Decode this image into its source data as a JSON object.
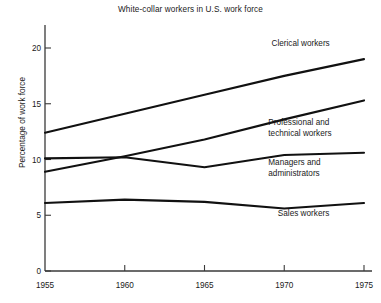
{
  "chart_data": {
    "type": "line",
    "title": "White-collar workers in U.S. work force",
    "xlabel": "",
    "ylabel": "Percentage of work force",
    "x": [
      1955,
      1960,
      1965,
      1970,
      1975
    ],
    "xticklabels": [
      "1955",
      "1960",
      "1965",
      "1970",
      "1975"
    ],
    "yticks": [
      0,
      5,
      10,
      15,
      20
    ],
    "yticklabels": [
      "0",
      "5",
      "10",
      "15",
      "20"
    ],
    "xlim": [
      1955,
      1975
    ],
    "ylim": [
      0,
      21.5
    ],
    "grid": false,
    "legend_position": "inline-right-of-series",
    "series": [
      {
        "name": "Clerical workers",
        "values": [
          12.4,
          14.1,
          15.8,
          17.5,
          19.0
        ],
        "label_x": 1969.2,
        "label_y": 20.2
      },
      {
        "name": "Professional and technical workers",
        "values": [
          8.9,
          10.3,
          11.8,
          13.6,
          15.3
        ],
        "label_x": 1969.0,
        "label_y": 13.1,
        "label_lines": [
          "Professional and",
          "technical workers"
        ]
      },
      {
        "name": "Managers and administrators",
        "values": [
          10.1,
          10.2,
          9.3,
          10.4,
          10.6
        ],
        "label_x": 1969.0,
        "label_y": 9.5,
        "label_lines": [
          "Managers and",
          "administrators"
        ]
      },
      {
        "name": "Sales workers",
        "values": [
          6.1,
          6.4,
          6.2,
          5.6,
          6.1
        ],
        "label_x": 1969.6,
        "label_y": 4.9
      }
    ]
  },
  "axes": {
    "y_tick_labels": [
      "20",
      "15",
      "10",
      "5",
      "0"
    ],
    "x_tick_labels": [
      "1955",
      "1960",
      "1965",
      "1970",
      "1975"
    ]
  },
  "labels": {
    "clerical": "Clerical workers",
    "professional_line1": "Professional and",
    "professional_line2": "technical workers",
    "managers_line1": "Managers and",
    "managers_line2": "administrators",
    "sales": "Sales workers"
  },
  "colors": {
    "background": "#ffffff",
    "line": "#111111",
    "axis": "#3a3a3a",
    "text": "#1a1a1a"
  }
}
